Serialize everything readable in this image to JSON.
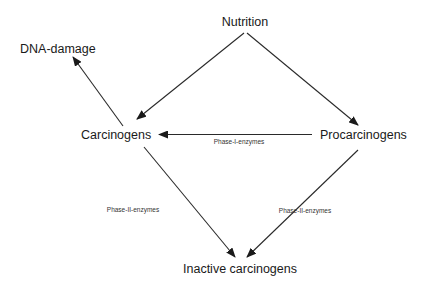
{
  "diagram": {
    "type": "metabolic-pathway",
    "nodes": {
      "nutrition": {
        "label": "Nutrition"
      },
      "dna_damage": {
        "label": "DNA-damage"
      },
      "carcinogens": {
        "label": "Carcinogens"
      },
      "procarcinogens": {
        "label": "Procarcinogens"
      },
      "inactive_carcinogens": {
        "label": "Inactive carcinogens"
      }
    },
    "edges": [
      {
        "from": "Nutrition",
        "to": "Carcinogens",
        "label": ""
      },
      {
        "from": "Nutrition",
        "to": "Procarcinogens",
        "label": ""
      },
      {
        "from": "Carcinogens",
        "to": "DNA-damage",
        "label": ""
      },
      {
        "from": "Procarcinogens",
        "to": "Carcinogens",
        "label": "Phase-I-enzymes"
      },
      {
        "from": "Carcinogens",
        "to": "Inactive carcinogens",
        "label": "Phase-II-enzymes"
      },
      {
        "from": "Procarcinogens",
        "to": "Inactive carcinogens",
        "label": "Phase-II-enzymes"
      }
    ],
    "edge_labels": {
      "phase1": "Phase-I-enzymes",
      "phase2_left": "Phase-II-enzymes",
      "phase2_right": "Phase-II-enzymes"
    },
    "colors": {
      "background": "#ffffff",
      "line": "#2a2a2a",
      "text": "#1a1a1a"
    }
  }
}
